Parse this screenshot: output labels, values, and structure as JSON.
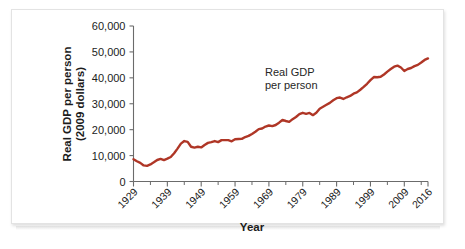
{
  "figure": {
    "background_color": "#ffffff",
    "border_color": "#e3e3e3"
  },
  "chart_data": {
    "type": "line",
    "title": "",
    "xlabel": "Year",
    "ylabel": "Real GDP per person\n(2009 dollars)",
    "ylabel_line1": "Real GDP per person",
    "ylabel_line2": "(2009 dollars)",
    "series_name": "Real GDP per person",
    "line_color": "#AF3626",
    "grid": false,
    "legend_position": "none",
    "xlim": [
      1929,
      2016
    ],
    "ylim": [
      0,
      60000
    ],
    "ytick_labels": [
      "0",
      "10,000",
      "20,000",
      "30,000",
      "40,000",
      "50,000",
      "60,000"
    ],
    "ytick_values": [
      0,
      10000,
      20000,
      30000,
      40000,
      50000,
      60000
    ],
    "xtick_labels": [
      "1929",
      "1939",
      "1949",
      "1959",
      "1969",
      "1979",
      "1989",
      "1999",
      "2009",
      "2016"
    ],
    "xtick_values": [
      1929,
      1939,
      1949,
      1959,
      1969,
      1979,
      1989,
      1999,
      2009,
      2016
    ],
    "annotations": [
      {
        "name": "series-callout",
        "line1": "Real GDP",
        "line2": "per person",
        "x": 1972,
        "y": 42000
      }
    ],
    "x": [
      1929,
      1930,
      1931,
      1932,
      1933,
      1934,
      1935,
      1936,
      1937,
      1938,
      1939,
      1940,
      1941,
      1942,
      1943,
      1944,
      1945,
      1946,
      1947,
      1948,
      1949,
      1950,
      1951,
      1952,
      1953,
      1954,
      1955,
      1956,
      1957,
      1958,
      1959,
      1960,
      1961,
      1962,
      1963,
      1964,
      1965,
      1966,
      1967,
      1968,
      1969,
      1970,
      1971,
      1972,
      1973,
      1974,
      1975,
      1976,
      1977,
      1978,
      1979,
      1980,
      1981,
      1982,
      1983,
      1984,
      1985,
      1986,
      1987,
      1988,
      1989,
      1990,
      1991,
      1992,
      1993,
      1994,
      1995,
      1996,
      1997,
      1998,
      1999,
      2000,
      2001,
      2002,
      2003,
      2004,
      2005,
      2006,
      2007,
      2008,
      2009,
      2010,
      2011,
      2012,
      2013,
      2014,
      2015,
      2016
    ],
    "values": [
      8600,
      7800,
      7200,
      6200,
      6050,
      6600,
      7400,
      8300,
      8700,
      8250,
      8800,
      9450,
      10900,
      12700,
      14600,
      15600,
      15300,
      13400,
      13100,
      13400,
      13150,
      14100,
      14900,
      15200,
      15600,
      15200,
      15950,
      15950,
      15950,
      15500,
      16300,
      16400,
      16450,
      17150,
      17600,
      18350,
      19200,
      20200,
      20450,
      21200,
      21600,
      21350,
      21800,
      22700,
      23750,
      23350,
      23000,
      24050,
      24900,
      26000,
      26500,
      26100,
      26450,
      25600,
      26500,
      28100,
      28850,
      29600,
      30350,
      31350,
      32150,
      32400,
      31850,
      32500,
      33000,
      33900,
      34400,
      35400,
      36500,
      37700,
      39100,
      40300,
      40200,
      40400,
      41300,
      42400,
      43400,
      44300,
      44700,
      44000,
      42650,
      43400,
      43800,
      44500,
      45000,
      45900,
      46900,
      47500
    ],
    "notable_features": [
      {
        "label": "Great Depression trough",
        "year": 1933,
        "value": 6050
      },
      {
        "label": "World War II peak",
        "year": 1944,
        "value": 15600
      },
      {
        "label": "Post-war drop",
        "year": 1947,
        "value": 13100
      },
      {
        "label": "1982 recession",
        "year": 1982,
        "value": 25600
      },
      {
        "label": "2009 recession trough",
        "year": 2009,
        "value": 42650
      },
      {
        "label": "Final value",
        "year": 2016,
        "value": 47500
      }
    ]
  }
}
